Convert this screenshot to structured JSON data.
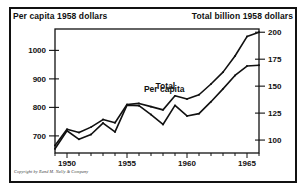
{
  "header": {
    "left_label": "Per capita 1958 dollars",
    "right_label": "Total billion 1958 dollars"
  },
  "footer": {
    "copyright": "Copyright by Rand M. Nally & Company"
  },
  "series_labels": {
    "total": "Total",
    "per_capita": "Per capita"
  },
  "colors": {
    "ink": "#111111",
    "background": "#ffffff"
  },
  "chart_data": {
    "type": "line",
    "title": "",
    "subtitle": "",
    "xlabel": "",
    "ylabel": "Per capita 1958 dollars",
    "y2label": "Total billion 1958 dollars",
    "grid": false,
    "legend": "inline-annotations",
    "xlim": [
      1949,
      1966
    ],
    "ylim": [
      640,
      1075
    ],
    "y2lim": [
      88,
      203
    ],
    "xticks": [
      1949,
      1950,
      1951,
      1952,
      1953,
      1954,
      1955,
      1956,
      1957,
      1958,
      1959,
      1960,
      1961,
      1962,
      1963,
      1964,
      1965,
      1966
    ],
    "xticklabels": [
      "",
      "1950",
      "",
      "",
      "",
      "",
      "1955",
      "",
      "",
      "",
      "",
      "1960",
      "",
      "",
      "",
      "",
      "1965",
      ""
    ],
    "yticks": [
      700,
      800,
      900,
      1000
    ],
    "yticklabels": [
      "700",
      "800",
      "900",
      "1000"
    ],
    "y2ticks": [
      100,
      125,
      150,
      175,
      200
    ],
    "y2ticklabels": [
      "100",
      "125",
      "150",
      "175",
      "200"
    ],
    "x": [
      1949,
      1950,
      1951,
      1952,
      1953,
      1954,
      1955,
      1956,
      1957,
      1958,
      1959,
      1960,
      1961,
      1962,
      1963,
      1964,
      1965,
      1966
    ],
    "series": [
      {
        "name": "Total",
        "axis": "right",
        "units": "billion 1958 dollars",
        "values": [
          95,
          110,
          107,
          112,
          119,
          116,
          133,
          134,
          131,
          128,
          141,
          138,
          142,
          152,
          163,
          178,
          196,
          200
        ]
      },
      {
        "name": "Per capita",
        "axis": "left",
        "units": "1958 dollars",
        "values": [
          655,
          718,
          688,
          705,
          745,
          714,
          808,
          806,
          775,
          740,
          807,
          770,
          778,
          820,
          865,
          912,
          945,
          948
        ]
      }
    ],
    "annotations": [
      {
        "text": "Total",
        "x": 1958.2,
        "y2": 147
      },
      {
        "text": "Per capita",
        "x": 1958.1,
        "y": 855
      }
    ]
  }
}
